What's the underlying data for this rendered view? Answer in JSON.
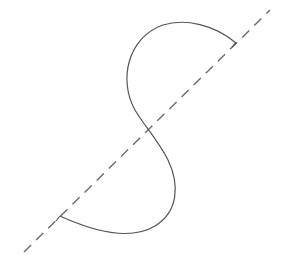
{
  "diagram": {
    "width": 282,
    "height": 273,
    "background": "#ffffff",
    "axis_line": {
      "style": "dashed",
      "color": "#6b6b6b",
      "stroke_width": 1.4,
      "dasharray": "10 7",
      "x1": 24,
      "y1": 252,
      "x2": 270,
      "y2": 10
    },
    "s_curve": {
      "color": "#555555",
      "stroke_width": 1.2,
      "path": "M 236 43 C 215 25, 185 18, 163 25 C 128 37, 118 80, 135 110 C 145 127, 158 140, 168 160 C 180 185, 178 212, 155 226 C 130 241, 95 232, 60 216",
      "start_point": [
        236,
        43
      ],
      "end_point": [
        60,
        216
      ]
    },
    "end_ticks": [
      {
        "x1": 236,
        "y1": 43,
        "x2": 232,
        "y2": 47
      },
      {
        "x1": 60,
        "y1": 216,
        "x2": 56,
        "y2": 221
      }
    ]
  }
}
